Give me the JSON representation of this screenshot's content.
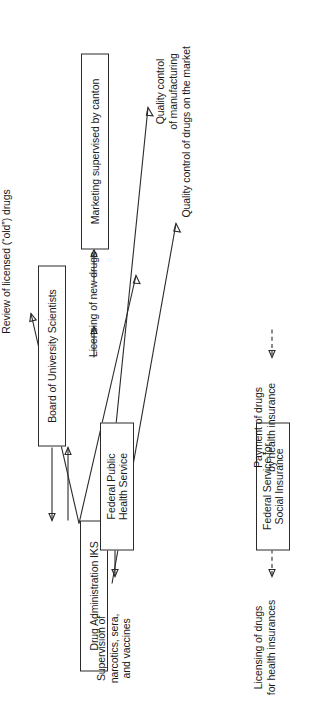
{
  "figure": {
    "kind": "flow-diagram",
    "orientation": "rotated-90-ccw",
    "ink_color": "#2a2a2a",
    "paper_color": "#ffffff"
  },
  "nodes": [
    {
      "id": "board",
      "label": "Board of University Scientists"
    },
    {
      "id": "iks",
      "label": "Drug Administration IKS"
    },
    {
      "id": "fphs",
      "label": "Federal Public\nHealth Service"
    },
    {
      "id": "fssi",
      "label": "Federal Service for\nSocial Insurance"
    },
    {
      "id": "marketing",
      "label": "Marketing supervised by canton"
    }
  ],
  "edge_labels": [
    {
      "id": "review",
      "text": "Review of licensed (“old”) drugs"
    },
    {
      "id": "licensing_new",
      "text": "Licensing of new drugs"
    },
    {
      "id": "supervision",
      "text": "Supervision of\nnarcotics, sera,\nand vaccines"
    },
    {
      "id": "licensing_hi",
      "text": "Licensing of drugs\nfor health insurances"
    },
    {
      "id": "payment",
      "text": "Payment of drugs\nby health insurance"
    },
    {
      "id": "qc_manu",
      "text": "Quality control\nof manufacturing"
    },
    {
      "id": "qc_market",
      "text": "Quality control of drugs on the market"
    }
  ]
}
